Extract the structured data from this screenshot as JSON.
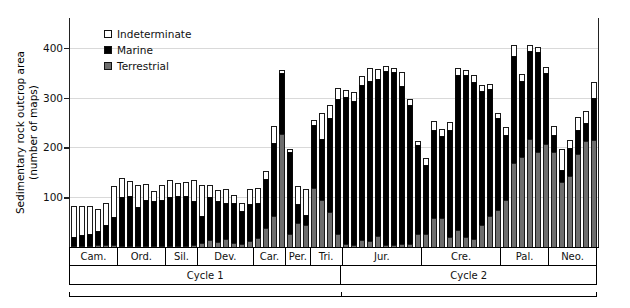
{
  "chart_data": {
    "type": "bar",
    "subtype": "stacked",
    "title": "",
    "xlabel": "",
    "ylabel": "Sedimentary rock outcrop area (number of maps)",
    "ylabel_line1": "Sedimentary rock outcrop area",
    "ylabel_line2": "(number of maps)",
    "ylim": [
      0,
      460
    ],
    "yticks": [
      100,
      200,
      300,
      400
    ],
    "ytick_labels": [
      "100",
      "200",
      "300",
      "400"
    ],
    "grid": "horizontal",
    "legend_position": "upper-left-inside",
    "legend": [
      {
        "label": "Indeterminate",
        "color": "#ffffff"
      },
      {
        "label": "Marine",
        "color": "#000000"
      },
      {
        "label": "Terrestrial",
        "color": "#6e6e6e"
      }
    ],
    "series": [
      {
        "name": "Terrestrial",
        "color": "#6e6e6e"
      },
      {
        "name": "Marine",
        "color": "#000000"
      },
      {
        "name": "Indeterminate",
        "color": "#ffffff"
      }
    ],
    "periods": [
      {
        "label": "Cam.",
        "name": "Cambrian",
        "bins": 6
      },
      {
        "label": "Ord.",
        "name": "Ordovician",
        "bins": 6
      },
      {
        "label": "Sil.",
        "name": "Silurian",
        "bins": 4
      },
      {
        "label": "Dev.",
        "name": "Devonian",
        "bins": 7
      },
      {
        "label": "Car.",
        "name": "Carboniferous",
        "bins": 4
      },
      {
        "label": "Per.",
        "name": "Permian",
        "bins": 3
      },
      {
        "label": "Tri.",
        "name": "Triassic",
        "bins": 4
      },
      {
        "label": "Jur.",
        "name": "Jurassic",
        "bins": 10
      },
      {
        "label": "Cre.",
        "name": "Cretaceous",
        "bins": 10
      },
      {
        "label": "Pal.",
        "name": "Paleogene",
        "bins": 6
      },
      {
        "label": "Neo.",
        "name": "Neogene",
        "bins": 6
      }
    ],
    "cycles": [
      {
        "label": "Cycle 1",
        "bins": 34
      },
      {
        "label": "Cycle 2",
        "bins": 32
      }
    ],
    "bins": [
      {
        "period": "Cam.",
        "terrestrial": 2,
        "marine": 18,
        "indeterminate": 62
      },
      {
        "period": "Cam.",
        "terrestrial": 3,
        "marine": 22,
        "indeterminate": 57
      },
      {
        "period": "Cam.",
        "terrestrial": 3,
        "marine": 24,
        "indeterminate": 55
      },
      {
        "period": "Cam.",
        "terrestrial": 4,
        "marine": 28,
        "indeterminate": 44
      },
      {
        "period": "Cam.",
        "terrestrial": 4,
        "marine": 40,
        "indeterminate": 45
      },
      {
        "period": "Cam.",
        "terrestrial": 4,
        "marine": 56,
        "indeterminate": 63
      },
      {
        "period": "Ord.",
        "terrestrial": 3,
        "marine": 98,
        "indeterminate": 37
      },
      {
        "period": "Ord.",
        "terrestrial": 3,
        "marine": 100,
        "indeterminate": 30
      },
      {
        "period": "Ord.",
        "terrestrial": 3,
        "marine": 78,
        "indeterminate": 44
      },
      {
        "period": "Ord.",
        "terrestrial": 3,
        "marine": 92,
        "indeterminate": 32
      },
      {
        "period": "Ord.",
        "terrestrial": 3,
        "marine": 90,
        "indeterminate": 20
      },
      {
        "period": "Ord.",
        "terrestrial": 3,
        "marine": 92,
        "indeterminate": 29
      },
      {
        "period": "Sil.",
        "terrestrial": 2,
        "marine": 98,
        "indeterminate": 34
      },
      {
        "period": "Sil.",
        "terrestrial": 2,
        "marine": 100,
        "indeterminate": 27
      },
      {
        "period": "Sil.",
        "terrestrial": 2,
        "marine": 100,
        "indeterminate": 28
      },
      {
        "period": "Sil.",
        "terrestrial": 5,
        "marine": 88,
        "indeterminate": 42
      },
      {
        "period": "Dev.",
        "terrestrial": 8,
        "marine": 55,
        "indeterminate": 62
      },
      {
        "period": "Dev.",
        "terrestrial": 14,
        "marine": 86,
        "indeterminate": 24
      },
      {
        "period": "Dev.",
        "terrestrial": 10,
        "marine": 82,
        "indeterminate": 22
      },
      {
        "period": "Dev.",
        "terrestrial": 17,
        "marine": 72,
        "indeterminate": 28
      },
      {
        "period": "Dev.",
        "terrestrial": 8,
        "marine": 80,
        "indeterminate": 17
      },
      {
        "period": "Dev.",
        "terrestrial": 6,
        "marine": 66,
        "indeterminate": 17
      },
      {
        "period": "Dev.",
        "terrestrial": 12,
        "marine": 74,
        "indeterminate": 31
      },
      {
        "period": "Car.",
        "terrestrial": 18,
        "marine": 70,
        "indeterminate": 30
      },
      {
        "period": "Car.",
        "terrestrial": 38,
        "marine": 98,
        "indeterminate": 16
      },
      {
        "period": "Car.",
        "terrestrial": 62,
        "marine": 146,
        "indeterminate": 36
      },
      {
        "period": "Car.",
        "terrestrial": 228,
        "marine": 122,
        "indeterminate": 6
      },
      {
        "period": "Per.",
        "terrestrial": 26,
        "marine": 164,
        "indeterminate": 6
      },
      {
        "period": "Per.",
        "terrestrial": 48,
        "marine": 38,
        "indeterminate": 36
      },
      {
        "period": "Per.",
        "terrestrial": 44,
        "marine": 20,
        "indeterminate": 52
      },
      {
        "period": "Tri.",
        "terrestrial": 118,
        "marine": 128,
        "indeterminate": 9
      },
      {
        "period": "Tri.",
        "terrestrial": 94,
        "marine": 124,
        "indeterminate": 52
      },
      {
        "period": "Tri.",
        "terrestrial": 70,
        "marine": 190,
        "indeterminate": 25
      },
      {
        "period": "Tri.",
        "terrestrial": 26,
        "marine": 272,
        "indeterminate": 22
      },
      {
        "period": "Jur.",
        "terrestrial": 6,
        "marine": 296,
        "indeterminate": 14
      },
      {
        "period": "Jur.",
        "terrestrial": 4,
        "marine": 290,
        "indeterminate": 18
      },
      {
        "period": "Jur.",
        "terrestrial": 14,
        "marine": 312,
        "indeterminate": 18
      },
      {
        "period": "Jur.",
        "terrestrial": 12,
        "marine": 322,
        "indeterminate": 25
      },
      {
        "period": "Jur.",
        "terrestrial": 22,
        "marine": 316,
        "indeterminate": 20
      },
      {
        "period": "Jur.",
        "terrestrial": 5,
        "marine": 348,
        "indeterminate": 10
      },
      {
        "period": "Jur.",
        "terrestrial": 5,
        "marine": 346,
        "indeterminate": 8
      },
      {
        "period": "Jur.",
        "terrestrial": 7,
        "marine": 316,
        "indeterminate": 28
      },
      {
        "period": "Jur.",
        "terrestrial": 6,
        "marine": 280,
        "indeterminate": 12
      },
      {
        "period": "Jur.",
        "terrestrial": 26,
        "marine": 178,
        "indeterminate": 8
      },
      {
        "period": "Cre.",
        "terrestrial": 26,
        "marine": 138,
        "indeterminate": 14
      },
      {
        "period": "Cre.",
        "terrestrial": 58,
        "marine": 178,
        "indeterminate": 18
      },
      {
        "period": "Cre.",
        "terrestrial": 58,
        "marine": 166,
        "indeterminate": 14
      },
      {
        "period": "Cre.",
        "terrestrial": 20,
        "marine": 216,
        "indeterminate": 16
      },
      {
        "period": "Cre.",
        "terrestrial": 34,
        "marine": 312,
        "indeterminate": 14
      },
      {
        "period": "Cre.",
        "terrestrial": 20,
        "marine": 326,
        "indeterminate": 10
      },
      {
        "period": "Cre.",
        "terrestrial": 16,
        "marine": 316,
        "indeterminate": 14
      },
      {
        "period": "Cre.",
        "terrestrial": 44,
        "marine": 270,
        "indeterminate": 12
      },
      {
        "period": "Cre.",
        "terrestrial": 62,
        "marine": 256,
        "indeterminate": 10
      },
      {
        "period": "Cre.",
        "terrestrial": 74,
        "marine": 186,
        "indeterminate": 10
      },
      {
        "period": "Pal.",
        "terrestrial": 94,
        "marine": 132,
        "indeterminate": 16
      },
      {
        "period": "Pal.",
        "terrestrial": 168,
        "marine": 216,
        "indeterminate": 22
      },
      {
        "period": "Pal.",
        "terrestrial": 180,
        "marine": 154,
        "indeterminate": 14
      },
      {
        "period": "Pal.",
        "terrestrial": 216,
        "marine": 178,
        "indeterminate": 12
      },
      {
        "period": "Pal.",
        "terrestrial": 190,
        "marine": 202,
        "indeterminate": 10
      },
      {
        "period": "Pal.",
        "terrestrial": 206,
        "marine": 144,
        "indeterminate": 12
      },
      {
        "period": "Neo.",
        "terrestrial": 190,
        "marine": 36,
        "indeterminate": 18
      },
      {
        "period": "Neo.",
        "terrestrial": 130,
        "marine": 24,
        "indeterminate": 42
      },
      {
        "period": "Neo.",
        "terrestrial": 142,
        "marine": 56,
        "indeterminate": 16
      },
      {
        "period": "Neo.",
        "terrestrial": 186,
        "marine": 50,
        "indeterminate": 26
      },
      {
        "period": "Neo.",
        "terrestrial": 212,
        "marine": 38,
        "indeterminate": 24
      },
      {
        "period": "Neo.",
        "terrestrial": 214,
        "marine": 86,
        "indeterminate": 32
      }
    ]
  }
}
